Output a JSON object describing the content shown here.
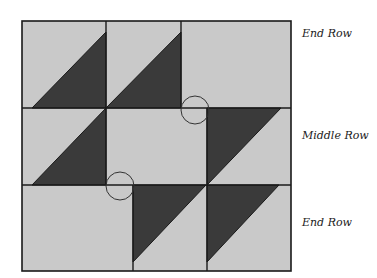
{
  "diagram": {
    "type": "quilt-block",
    "colors": {
      "light_fabric": "#c9c9c9",
      "dark_fabric": "#3a3a3a",
      "seam_line": "#1a1a1a",
      "background": "#ffffff"
    },
    "rows": [
      {
        "label": "End Row",
        "position": "top"
      },
      {
        "label": "Middle Row",
        "position": "middle"
      },
      {
        "label": "End Row",
        "position": "bottom"
      }
    ],
    "seam_circles": 2
  }
}
